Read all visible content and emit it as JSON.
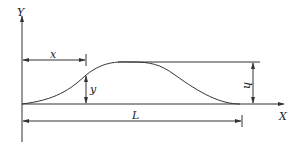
{
  "diagram": {
    "type": "bump-curve-dimension-sketch",
    "stroke_color": "#333333",
    "background": "#ffffff",
    "axes": {
      "x_label": "X",
      "y_label": "Y"
    },
    "dimensions": {
      "x": "x",
      "y": "y",
      "h": "h",
      "L": "L"
    }
  }
}
